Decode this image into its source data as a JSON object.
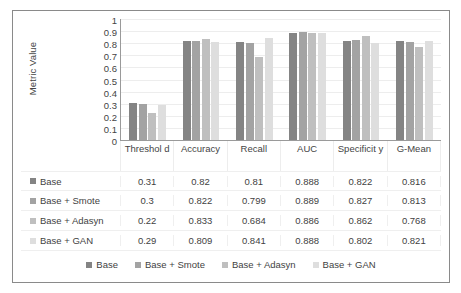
{
  "chart_data": {
    "type": "bar",
    "title": "",
    "xlabel": "",
    "ylabel": "Metric Value",
    "ylim": [
      0,
      1
    ],
    "yticks": [
      "1",
      "0.9",
      "0.8",
      "0.7",
      "0.6",
      "0.5",
      "0.4",
      "0.3",
      "0.2",
      "0.1",
      "0"
    ],
    "ytick_values": [
      1,
      0.9,
      0.8,
      0.7,
      0.6,
      0.5,
      0.4,
      0.3,
      0.2,
      0.1,
      0
    ],
    "grid": true,
    "legend_position": "bottom",
    "categories": [
      "Threshold",
      "Accuracy",
      "Recall",
      "AUC",
      "Specificity",
      "G-Mean"
    ],
    "category_display": [
      "Threshol d",
      "Accuracy",
      "Recall",
      "AUC",
      "Specificit y",
      "G-Mean"
    ],
    "series": [
      {
        "name": "Base",
        "color": "#848484",
        "values": [
          0.31,
          0.82,
          0.81,
          0.888,
          0.822,
          0.816
        ],
        "labels": [
          "0.31",
          "0.82",
          "0.81",
          "0.888",
          "0.822",
          "0.816"
        ]
      },
      {
        "name": "Base + Smote",
        "color": "#a3a3a3",
        "values": [
          0.3,
          0.822,
          0.799,
          0.889,
          0.827,
          0.813
        ],
        "labels": [
          "0.3",
          "0.822",
          "0.799",
          "0.889",
          "0.827",
          "0.813"
        ]
      },
      {
        "name": "Base + Adasyn",
        "color": "#bfbfbf",
        "values": [
          0.22,
          0.833,
          0.684,
          0.886,
          0.862,
          0.768
        ],
        "labels": [
          "0.22",
          "0.833",
          "0.684",
          "0.886",
          "0.862",
          "0.768"
        ]
      },
      {
        "name": "Base + GAN",
        "color": "#dedede",
        "values": [
          0.29,
          0.809,
          0.841,
          0.888,
          0.802,
          0.821
        ],
        "labels": [
          "0.29",
          "0.809",
          "0.841",
          "0.888",
          "0.802",
          "0.821"
        ]
      }
    ]
  }
}
